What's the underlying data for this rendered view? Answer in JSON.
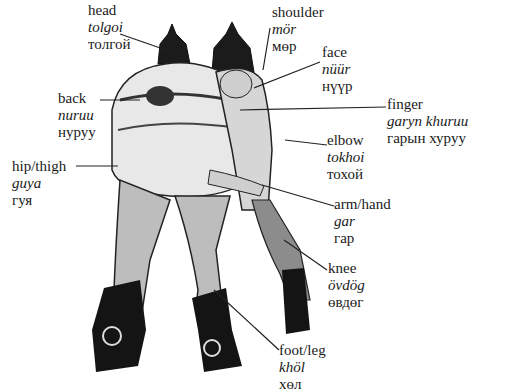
{
  "figure": {
    "labels": [
      {
        "id": "head",
        "english": "head",
        "romanized": "tolgoi",
        "cyrillic": "толгой",
        "pos": [
          88,
          2
        ],
        "line": [
          [
            120,
            34
          ],
          [
            166,
            50
          ]
        ]
      },
      {
        "id": "shoulder",
        "english": "shoulder",
        "romanized": "mör",
        "cyrillic": "мөр",
        "pos": [
          272,
          4
        ],
        "line": [
          [
            270,
            28
          ],
          [
            263,
            70
          ]
        ]
      },
      {
        "id": "face",
        "english": "face",
        "romanized": "nüür",
        "cyrillic": "нүүр",
        "pos": [
          322,
          44
        ],
        "line": [
          [
            320,
            62
          ],
          [
            254,
            88
          ]
        ]
      },
      {
        "id": "back",
        "english": "back",
        "romanized": "nuruu",
        "cyrillic": "нуруу",
        "pos": [
          58,
          90
        ],
        "line": [
          [
            100,
            100
          ],
          [
            140,
            100
          ]
        ]
      },
      {
        "id": "finger",
        "english": "finger",
        "romanized": "garyn khuruu",
        "cyrillic": "гарын хуруу",
        "pos": [
          387,
          96
        ],
        "line": [
          [
            386,
            107
          ],
          [
            240,
            110
          ]
        ]
      },
      {
        "id": "elbow",
        "english": "elbow",
        "romanized": "tokhoi",
        "cyrillic": "тохой",
        "pos": [
          327,
          132
        ],
        "line": [
          [
            327,
            145
          ],
          [
            285,
            140
          ]
        ]
      },
      {
        "id": "hip-thigh",
        "english": "hip/thigh",
        "romanized": "guya",
        "cyrillic": "гуя",
        "pos": [
          12,
          152
        ],
        "line": [
          [
            76,
            166
          ],
          [
            118,
            166
          ]
        ]
      },
      {
        "id": "arm-hand",
        "english": "arm/hand",
        "romanized": "gar",
        "cyrillic": "гар",
        "pos": [
          334,
          196
        ],
        "line": [
          [
            334,
            206
          ],
          [
            262,
            185
          ]
        ]
      },
      {
        "id": "knee",
        "english": "knee",
        "romanized": "övdög",
        "cyrillic": "өвдөг",
        "pos": [
          328,
          258
        ],
        "line": [
          [
            327,
            270
          ],
          [
            284,
            240
          ]
        ]
      },
      {
        "id": "foot-leg",
        "english": "foot/leg",
        "romanized": "khöl",
        "cyrillic": "хөл",
        "pos": [
          279,
          340
        ],
        "line": [
          [
            279,
            350
          ],
          [
            214,
            290
          ]
        ]
      }
    ]
  }
}
